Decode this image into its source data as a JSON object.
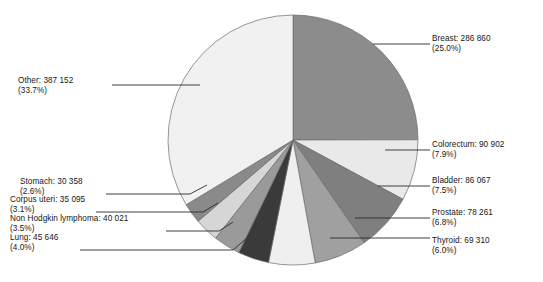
{
  "chart_data": {
    "type": "pie",
    "title": "",
    "subtitle": "",
    "xlabel": "",
    "ylabel": "",
    "legend_position": "none",
    "grid": false,
    "value_suffix": "",
    "total": 1148672,
    "categories": [
      "Breast",
      "Colorectum",
      "Bladder",
      "Prostate",
      "Thyroid",
      "Lung",
      "Non Hodgkin lymphoma",
      "Corpus uteri",
      "Stomach",
      "Other"
    ],
    "values": [
      286860,
      90902,
      86067,
      78261,
      69310,
      45646,
      40021,
      35095,
      30358,
      387152
    ],
    "percents": [
      25.0,
      7.9,
      7.5,
      6.8,
      6.0,
      4.0,
      3.5,
      3.1,
      2.6,
      33.7
    ],
    "colors": [
      "#8c8c8c",
      "#e9e9e9",
      "#7f7f7f",
      "#a0a0a0",
      "#efefef",
      "#3a3a3a",
      "#9a9a9a",
      "#d6d6d6",
      "#8a8a8a",
      "#f1f1f1"
    ],
    "slices": [
      {
        "label": "Breast",
        "value": "286 860",
        "percent": "(25.0%)",
        "color": "#8c8c8c"
      },
      {
        "label": "Colorectum",
        "value": "90 902",
        "percent": "(7.9%)",
        "color": "#e9e9e9"
      },
      {
        "label": "Bladder",
        "value": "86 067",
        "percent": "(7.5%)",
        "color": "#7f7f7f"
      },
      {
        "label": "Prostate",
        "value": "78 261",
        "percent": "(6.8%)",
        "color": "#a0a0a0"
      },
      {
        "label": "Thyroid",
        "value": "69 310",
        "percent": "(6.0%)",
        "color": "#efefef"
      },
      {
        "label": "Lung",
        "value": "45 646",
        "percent": "(4.0%)",
        "color": "#3a3a3a"
      },
      {
        "label": "Non Hodgkin lymphoma",
        "value": "40 021",
        "percent": "(3.5%)",
        "color": "#9a9a9a"
      },
      {
        "label": "Corpus uteri",
        "value": "35 095",
        "percent": "(3.1%)",
        "color": "#d6d6d6"
      },
      {
        "label": "Stomach",
        "value": "30 358",
        "percent": "(2.6%)",
        "color": "#8a8a8a"
      },
      {
        "label": "Other",
        "value": "387 152",
        "percent": "(33.7%)",
        "color": "#f1f1f1"
      }
    ]
  },
  "labels": {
    "breast": {
      "text": "Breast: 286 860",
      "pct": "(25.0%)"
    },
    "colorectum": {
      "text": "Colorectum: 90 902",
      "pct": "(7.9%)"
    },
    "bladder": {
      "text": "Bladder: 86 067",
      "pct": "(7.5%)"
    },
    "prostate": {
      "text": "Prostate: 78 261",
      "pct": "(6.8%)"
    },
    "thyroid": {
      "text": "Thyroid: 69 310",
      "pct": "(6.0%)"
    },
    "lung": {
      "text": "Lung: 45 646",
      "pct": "(4.0%)"
    },
    "nhl": {
      "text": "Non Hodgkin lymphoma: 40 021",
      "pct": "(3.5%)"
    },
    "corpus": {
      "text": "Corpus uteri: 35 095",
      "pct": "(3.1%)"
    },
    "stomach": {
      "text": "Stomach: 30 358",
      "pct": "(2.6%)"
    },
    "other": {
      "text": "Other: 387 152",
      "pct": "(33.7%)"
    }
  },
  "style": {
    "outline_color": "#6b6b6b",
    "leader_color": "#2a2a2a",
    "background": "#ffffff"
  }
}
